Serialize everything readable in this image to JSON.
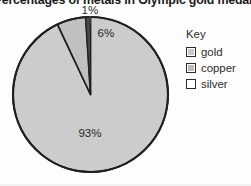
{
  "title": "Percentages of metals in Olympic gold medal",
  "key": {
    "heading": "Key",
    "items": [
      {
        "label": "gold",
        "swatch_color": "#c9c9c9"
      },
      {
        "label": "copper",
        "swatch_color": "#bdbdbd"
      },
      {
        "label": "silver",
        "swatch_color": "#ffffff"
      }
    ]
  },
  "labels": {
    "gold": "93%",
    "copper": "6%",
    "silver": "1%"
  },
  "colors": {
    "gold_slice": "#cccccc",
    "copper_slice": "#c0c0c0",
    "silver_slice": "#4a4a4a",
    "outline": "#1f1f1f",
    "text": "#2a2a2a",
    "background": "#fdfdfd"
  },
  "chart_data": {
    "type": "pie",
    "title": "Percentages of metals in Olympic gold medal",
    "xlabel": "",
    "ylabel": "",
    "unit": "%",
    "legend_position": "right",
    "grid": false,
    "categories": [
      "gold",
      "copper",
      "silver"
    ],
    "values": [
      93,
      6,
      1
    ],
    "data_labels": [
      "93%",
      "6%",
      "1%"
    ],
    "slices": [
      {
        "name": "gold",
        "value": 93,
        "label": "93%",
        "color": "#cccccc"
      },
      {
        "name": "copper",
        "value": 6,
        "label": "6%",
        "color": "#c0c0c0"
      },
      {
        "name": "silver",
        "value": 1,
        "label": "1%",
        "color": "#4a4a4a"
      }
    ],
    "total": 100,
    "start_angle_deg": 0,
    "direction": "clockwise"
  }
}
